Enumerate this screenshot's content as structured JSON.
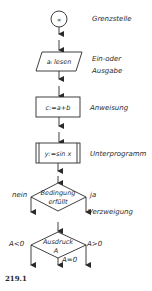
{
  "figure": {
    "caption": "219.1",
    "symbols": [
      {
        "id": "terminal",
        "shape": "circle",
        "inner_text": "∝",
        "label": "Grenzstelle"
      },
      {
        "id": "io",
        "shape": "parallelogram",
        "inner_text": "aᵢ lesen",
        "label_line1": "Ein-oder",
        "label_line2": "Ausgabe"
      },
      {
        "id": "process",
        "shape": "rectangle",
        "inner_text": "c:=a+b",
        "label": "Anweisung"
      },
      {
        "id": "subroutine",
        "shape": "rectangle-double-sides",
        "inner_text": "y:=sin x",
        "label": "Unterprogramm"
      },
      {
        "id": "decision",
        "shape": "diamond",
        "inner_line1": "Bedingung",
        "inner_line2": "erfüllt",
        "left_label": "nein",
        "right_label": "ja"
      },
      {
        "id": "multi-branch",
        "shape": "diamond",
        "inner_line1": "Ausdruck",
        "inner_line2": "A",
        "left_label": "A<0",
        "right_label": "A>0",
        "bottom_label": "A=0"
      }
    ],
    "branch_group_label": "Verzweigung"
  }
}
